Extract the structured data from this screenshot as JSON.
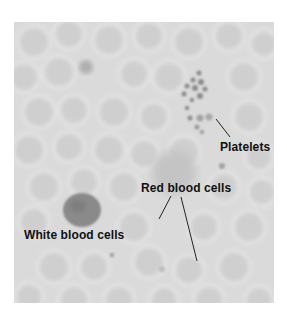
{
  "figure": {
    "background_color": "#d9d9d9",
    "labels": {
      "platelets": "Platelets",
      "red_blood_cells": "Red blood cells",
      "white_blood_cells": "White blood cells"
    }
  }
}
